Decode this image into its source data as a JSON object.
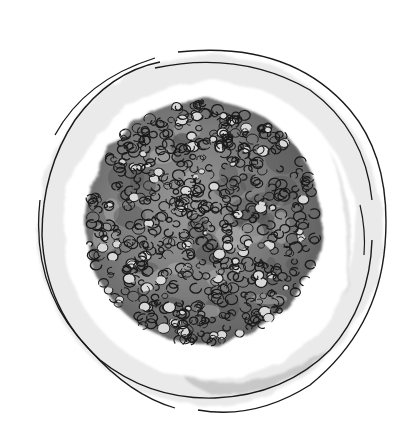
{
  "scene": {
    "subject": "plate-with-grain-mound",
    "style": "pen-and-ink-with-gray-watercolor-wash",
    "background_color": "#ffffff",
    "ink_color": "#1a1a1a"
  },
  "plate": {
    "cx": 206,
    "cy": 225,
    "outer_rx": 176,
    "outer_ry": 182,
    "inner_rx": 168,
    "inner_ry": 170,
    "rim_wash_color": "#d4d4d4",
    "shadow_color": "#bdbdbd"
  },
  "food": {
    "cx": 203,
    "cy": 222,
    "rx": 119,
    "ry": 124,
    "base_color": "#6e6e6e",
    "mid_color": "#8e8e8e",
    "highlight_color": "#d8d8d8",
    "grain_count": 620,
    "seed": 17
  }
}
